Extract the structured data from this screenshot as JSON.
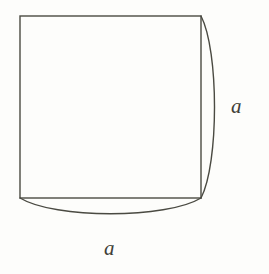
{
  "figure": {
    "background_color": "#fdfdfb",
    "stroke_color": "#4a4a42",
    "stroke_width": 1.4,
    "labels": {
      "right_side": "a",
      "bottom_side": "a"
    },
    "geometry": {
      "square": {
        "name": "square",
        "left": 20,
        "top": 16,
        "right": 201,
        "bottom": 198,
        "width": 181,
        "height": 182,
        "side_length_symbol": "a"
      },
      "right_arc": {
        "name": "right-arc",
        "start_x": 201,
        "start_y": 16,
        "end_x": 201,
        "end_y": 198,
        "bulge_direction": "right",
        "bulge_depth": 18,
        "apex_x": 219,
        "apex_y": 107
      },
      "bottom_arc": {
        "name": "bottom-arc",
        "start_x": 20,
        "start_y": 198,
        "end_x": 201,
        "end_y": 198,
        "bulge_direction": "down",
        "bulge_depth": 21,
        "apex_x": 110,
        "apex_y": 219
      }
    }
  }
}
